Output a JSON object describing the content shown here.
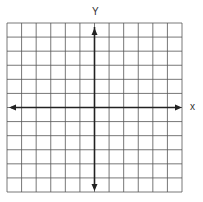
{
  "diagram": {
    "type": "coordinate-grid",
    "x_axis_label": "x",
    "y_axis_label": "Y",
    "grid": {
      "columns": 12,
      "rows": 12,
      "left": 7,
      "top": 23,
      "right": 182,
      "bottom": 192,
      "y_axis_column_index": 6,
      "x_axis_row_index": 6
    },
    "colors": {
      "grid_line": "#555555",
      "axis": "#222222",
      "background": "#ffffff"
    },
    "arrows": [
      "left",
      "right",
      "up",
      "down"
    ]
  }
}
